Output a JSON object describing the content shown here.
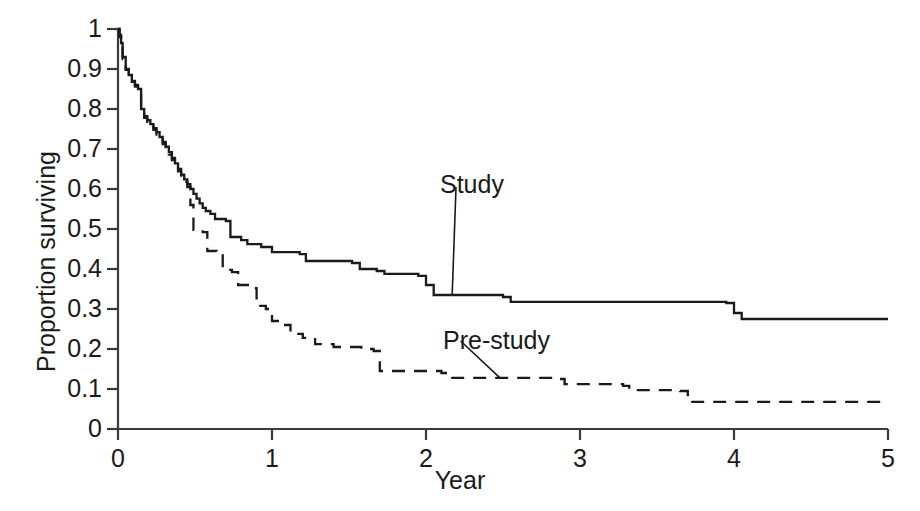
{
  "chart_data": {
    "type": "line",
    "subtype": "kaplan-meier-step",
    "title": "",
    "xlabel": "Year",
    "ylabel": "Proportion surviving",
    "xlim": [
      0,
      5
    ],
    "ylim": [
      0,
      1
    ],
    "xticks": [
      0,
      1,
      2,
      3,
      4,
      5
    ],
    "xtick_labels": [
      "0",
      "1",
      "2",
      "3",
      "4",
      "5"
    ],
    "yticks": [
      0,
      0.1,
      0.2,
      0.3,
      0.4,
      0.5,
      0.6,
      0.7,
      0.8,
      0.9,
      1
    ],
    "ytick_labels": [
      "0",
      "0.1",
      "0.2",
      "0.3",
      "0.4",
      "0.5",
      "0.6",
      "0.7",
      "0.8",
      "0.9",
      "1"
    ],
    "grid": false,
    "legend_position": "inline-annotations",
    "annotations": [
      {
        "text": "Study",
        "x": 2.13,
        "y": 0.63,
        "points_to_x": 2.17,
        "points_to_y": 0.335
      },
      {
        "text": "Pre-study",
        "x": 2.16,
        "y": 0.245,
        "points_to_x": 2.48,
        "points_to_y": 0.128
      }
    ],
    "series": [
      {
        "name": "Study",
        "style": "solid",
        "color": "#1a1a1a",
        "points": [
          [
            0.0,
            1.0
          ],
          [
            0.01,
            0.985
          ],
          [
            0.02,
            0.965
          ],
          [
            0.03,
            0.93
          ],
          [
            0.05,
            0.9
          ],
          [
            0.07,
            0.885
          ],
          [
            0.09,
            0.87
          ],
          [
            0.11,
            0.86
          ],
          [
            0.13,
            0.85
          ],
          [
            0.15,
            0.8
          ],
          [
            0.17,
            0.782
          ],
          [
            0.19,
            0.772
          ],
          [
            0.21,
            0.762
          ],
          [
            0.23,
            0.752
          ],
          [
            0.25,
            0.742
          ],
          [
            0.27,
            0.73
          ],
          [
            0.29,
            0.718
          ],
          [
            0.31,
            0.706
          ],
          [
            0.33,
            0.692
          ],
          [
            0.35,
            0.678
          ],
          [
            0.37,
            0.664
          ],
          [
            0.39,
            0.65
          ],
          [
            0.41,
            0.636
          ],
          [
            0.43,
            0.624
          ],
          [
            0.45,
            0.612
          ],
          [
            0.47,
            0.6
          ],
          [
            0.49,
            0.588
          ],
          [
            0.51,
            0.576
          ],
          [
            0.53,
            0.564
          ],
          [
            0.55,
            0.553
          ],
          [
            0.57,
            0.545
          ],
          [
            0.6,
            0.538
          ],
          [
            0.63,
            0.525
          ],
          [
            0.7,
            0.52
          ],
          [
            0.73,
            0.48
          ],
          [
            0.8,
            0.472
          ],
          [
            0.84,
            0.462
          ],
          [
            0.93,
            0.455
          ],
          [
            1.0,
            0.442
          ],
          [
            1.18,
            0.437
          ],
          [
            1.22,
            0.42
          ],
          [
            1.52,
            0.415
          ],
          [
            1.57,
            0.4
          ],
          [
            1.68,
            0.395
          ],
          [
            1.73,
            0.388
          ],
          [
            1.95,
            0.383
          ],
          [
            2.0,
            0.36
          ],
          [
            2.05,
            0.335
          ],
          [
            2.5,
            0.33
          ],
          [
            2.55,
            0.318
          ],
          [
            3.95,
            0.315
          ],
          [
            4.0,
            0.29
          ],
          [
            4.05,
            0.275
          ],
          [
            5.0,
            0.275
          ]
        ]
      },
      {
        "name": "Pre-study",
        "style": "dashed",
        "color": "#1a1a1a",
        "points": [
          [
            0.0,
            1.0
          ],
          [
            0.01,
            0.98
          ],
          [
            0.02,
            0.958
          ],
          [
            0.03,
            0.925
          ],
          [
            0.05,
            0.898
          ],
          [
            0.07,
            0.882
          ],
          [
            0.09,
            0.868
          ],
          [
            0.11,
            0.856
          ],
          [
            0.13,
            0.846
          ],
          [
            0.15,
            0.796
          ],
          [
            0.17,
            0.778
          ],
          [
            0.19,
            0.768
          ],
          [
            0.21,
            0.758
          ],
          [
            0.23,
            0.748
          ],
          [
            0.25,
            0.736
          ],
          [
            0.27,
            0.724
          ],
          [
            0.29,
            0.712
          ],
          [
            0.31,
            0.7
          ],
          [
            0.33,
            0.686
          ],
          [
            0.35,
            0.672
          ],
          [
            0.37,
            0.658
          ],
          [
            0.39,
            0.644
          ],
          [
            0.41,
            0.63
          ],
          [
            0.43,
            0.618
          ],
          [
            0.45,
            0.605
          ],
          [
            0.47,
            0.56
          ],
          [
            0.49,
            0.498
          ],
          [
            0.55,
            0.492
          ],
          [
            0.58,
            0.445
          ],
          [
            0.64,
            0.438
          ],
          [
            0.68,
            0.398
          ],
          [
            0.74,
            0.392
          ],
          [
            0.78,
            0.36
          ],
          [
            0.86,
            0.352
          ],
          [
            0.9,
            0.308
          ],
          [
            0.96,
            0.3
          ],
          [
            1.0,
            0.27
          ],
          [
            1.06,
            0.26
          ],
          [
            1.12,
            0.238
          ],
          [
            1.2,
            0.228
          ],
          [
            1.28,
            0.212
          ],
          [
            1.4,
            0.205
          ],
          [
            1.58,
            0.2
          ],
          [
            1.66,
            0.195
          ],
          [
            1.7,
            0.145
          ],
          [
            2.1,
            0.14
          ],
          [
            2.15,
            0.128
          ],
          [
            2.85,
            0.125
          ],
          [
            2.9,
            0.112
          ],
          [
            3.28,
            0.108
          ],
          [
            3.32,
            0.097
          ],
          [
            3.65,
            0.095
          ],
          [
            3.7,
            0.068
          ],
          [
            5.0,
            0.068
          ]
        ]
      }
    ]
  },
  "axes": {
    "origin_px": {
      "x": 118,
      "y": 429
    },
    "x_right_px": 888,
    "y_top_px": 29
  }
}
